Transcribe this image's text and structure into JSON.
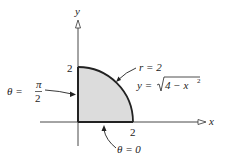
{
  "diagram": {
    "axes": {
      "x_label": "x",
      "y_label": "y",
      "x_tick": "2",
      "y_tick": "2"
    },
    "region": {
      "description": "quarter disk of radius 2 in the first quadrant",
      "fill_color": "#dcdcdc",
      "stroke_color": "#222222"
    },
    "annotations": {
      "curve_polar": "r = 2",
      "curve_cartesian_lhs": "y = ",
      "curve_cartesian_radicand": "4 − x",
      "curve_cartesian_exp": "2",
      "theta_top_lhs": "θ =",
      "theta_top_num": "π",
      "theta_top_den": "2",
      "theta_bottom": "θ = 0"
    }
  }
}
